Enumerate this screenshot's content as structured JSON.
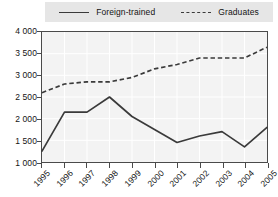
{
  "chart_data": {
    "type": "line",
    "title": "",
    "xlabel": "",
    "ylabel": "",
    "categories": [
      "1995",
      "1996",
      "1997",
      "1998",
      "1999",
      "2000",
      "2001",
      "2002",
      "2003",
      "2004",
      "2005"
    ],
    "series": [
      {
        "name": "Foreign-trained",
        "style": "solid",
        "values": [
          1250,
          2150,
          2150,
          2500,
          2050,
          1750,
          1450,
          1600,
          1700,
          1350,
          1800
        ]
      },
      {
        "name": "Graduates",
        "style": "dashed",
        "values": [
          2600,
          2800,
          2850,
          2850,
          2950,
          3150,
          3250,
          3400,
          3400,
          3400,
          3650
        ]
      }
    ],
    "ylim": [
      1000,
      4000
    ],
    "yticks": [
      "1 000",
      "1 500",
      "2 000",
      "2 500",
      "3 000",
      "3 500",
      "4 000"
    ],
    "ytick_values": [
      1000,
      1500,
      2000,
      2500,
      3000,
      3500,
      4000
    ],
    "grid": true,
    "legend_position": "top"
  },
  "legend": {
    "entries": [
      {
        "label": "Foreign-trained",
        "style": "solid"
      },
      {
        "label": "Graduates",
        "style": "dashed"
      }
    ]
  },
  "colors": {
    "line": "#3a3a3a",
    "plot_background": "#f3f3f3",
    "legend_background": "#e6e6e6",
    "grid": "#ffffff",
    "axis": "#4a4a4a",
    "text": "#141414"
  }
}
